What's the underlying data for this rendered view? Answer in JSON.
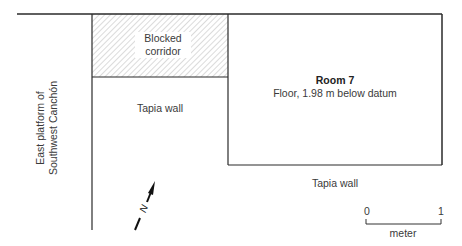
{
  "plan": {
    "corridor_label_line1": "Blocked",
    "corridor_label_line2": "corridor",
    "tapia_wall_upper": "Tapia wall",
    "tapia_wall_lower": "Tapia wall",
    "room_title": "Room 7",
    "room_subtitle": "Floor, 1.98 m below datum",
    "side_label_line1": "East platform of",
    "side_label_line2": "Southwest Canchón",
    "north_label": "N"
  },
  "scale_bar": {
    "start": "0",
    "end": "1",
    "unit": "meter"
  },
  "colors": {
    "line": "#2a2a2a",
    "hatch": "#b0b0b0",
    "text": "#3a3a3a"
  }
}
